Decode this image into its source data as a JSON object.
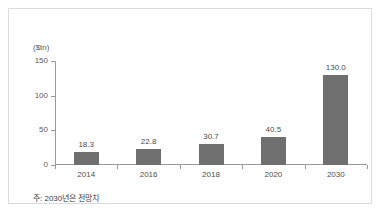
{
  "figure": {
    "unit_label": "($tn)",
    "footnote": "주: 2030년은 전망치",
    "bar_color": "#6f6f6f",
    "axis_color": "#9a9a9a",
    "frame_color": "#dcdcdc",
    "background": "#ffffff"
  },
  "chart_data": {
    "type": "bar",
    "title": "",
    "subtitle": "",
    "xlabel": "",
    "ylabel": "($tn)",
    "categories": [
      "2014",
      "2016",
      "2018",
      "2020",
      "2030"
    ],
    "values": [
      18.3,
      22.8,
      30.7,
      40.5,
      130.0
    ],
    "value_labels": [
      "18.3",
      "22.8",
      "30.7",
      "40.5",
      "130.0"
    ],
    "ylim": [
      0,
      150
    ],
    "yticks": [
      0,
      50,
      100,
      150
    ],
    "ytick_labels": [
      "0",
      "50",
      "100",
      "150"
    ],
    "grid": false,
    "legend": null,
    "annotations": [
      "주: 2030년은 전망치"
    ]
  }
}
